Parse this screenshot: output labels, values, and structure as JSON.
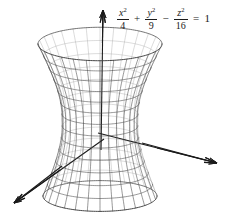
{
  "figure": {
    "kind": "quadric-surface-plot",
    "surface_name": "hyperboloid-of-one-sheet",
    "background_color": "#ffffff",
    "equation": {
      "term1": {
        "numerator": "x",
        "numerator_exponent": "2",
        "denominator": "4"
      },
      "operator1": "+",
      "term2": {
        "numerator": "y",
        "numerator_exponent": "2",
        "denominator": "9"
      },
      "operator2": "−",
      "term3": {
        "numerator": "z",
        "numerator_exponent": "2",
        "denominator": "16"
      },
      "equals": "=",
      "right_hand_side": "1",
      "plain_text": "x^2/4 + y^2/9 - z^2/16 = 1"
    },
    "mesh": {
      "line_color": "#6f6f6f",
      "front_line_color": "#4a4a4a",
      "back_line_color": "#9a9a9a",
      "line_width": 0.6,
      "u_divisions": 28,
      "v_divisions": 13,
      "center_x": 100,
      "center_y": 120,
      "waist_radius_x": 38,
      "top_radius_x": 62,
      "bottom_radius_x": 57,
      "ellipse_flatten": 0.27,
      "half_height": 76,
      "top_y": 45,
      "bottom_y": 196,
      "waist_y": 127
    },
    "axes": {
      "color": "#1a1a1a",
      "line_width": 1.1,
      "origin_x": 100,
      "origin_y": 135,
      "z_axis": {
        "label": "z-axis",
        "tip_x": 103,
        "tip_y": 10,
        "tail_x": 101,
        "tail_y": 150,
        "arrow": "up"
      },
      "y_axis": {
        "label": "y-axis",
        "tip_x": 217,
        "tip_y": 163,
        "tail_x": 98,
        "tail_y": 133,
        "arrow": "right-down"
      },
      "x_axis": {
        "label": "x-axis",
        "tip_x": 14,
        "tip_y": 203,
        "tail_x": 104,
        "tail_y": 139,
        "arrow": "left-down"
      }
    }
  }
}
